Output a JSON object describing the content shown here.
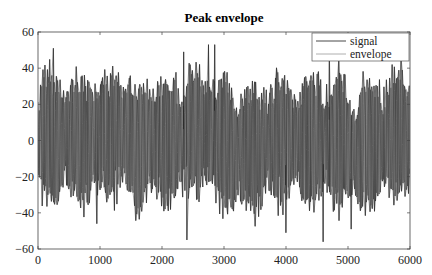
{
  "chart_data": {
    "type": "line",
    "title": "Peak envelope",
    "xlabel": "",
    "ylabel": "",
    "xlim": [
      0,
      6000
    ],
    "ylim": [
      -60,
      60
    ],
    "xticks": [
      0,
      1000,
      2000,
      3000,
      4000,
      5000,
      6000
    ],
    "yticks": [
      60,
      40,
      20,
      0,
      -20,
      -40,
      -60
    ],
    "xtick_labels": [
      "0",
      "1000",
      "2000",
      "3000",
      "4000",
      "5000",
      "6000"
    ],
    "ytick_labels": [
      "60",
      "40",
      "20",
      "0",
      "−20",
      "−40",
      "−60"
    ],
    "grid": false,
    "legend_position": "upper right",
    "series": [
      {
        "name": "signal",
        "color": "#1a1a1a",
        "description": "Dense noisy oscillating signal roughly bounded between -55 and 52, centered near 0, with ~6000 samples",
        "approx_range": [
          -55,
          52
        ]
      },
      {
        "name": "envelope",
        "color": "#8c8c8c",
        "description": "Lighter gray peak envelope curves (upper and lower) tracing local maxima/minima of signal",
        "approx_range": [
          -55,
          52
        ]
      }
    ],
    "notable_peaks": [
      {
        "x": 250,
        "y": 51
      },
      {
        "x": 2350,
        "y": 49
      },
      {
        "x": 2750,
        "y": 53
      },
      {
        "x": 2850,
        "y": 53
      },
      {
        "x": 4700,
        "y": 47
      },
      {
        "x": 4850,
        "y": 45
      }
    ],
    "notable_troughs": [
      {
        "x": 950,
        "y": -46
      },
      {
        "x": 2400,
        "y": -55
      },
      {
        "x": 4000,
        "y": -51
      },
      {
        "x": 4600,
        "y": -56
      },
      {
        "x": 5050,
        "y": -49
      }
    ]
  },
  "legend": {
    "items": [
      {
        "label": "signal",
        "color": "#1a1a1a"
      },
      {
        "label": "envelope",
        "color": "#9a9a9a"
      }
    ]
  }
}
